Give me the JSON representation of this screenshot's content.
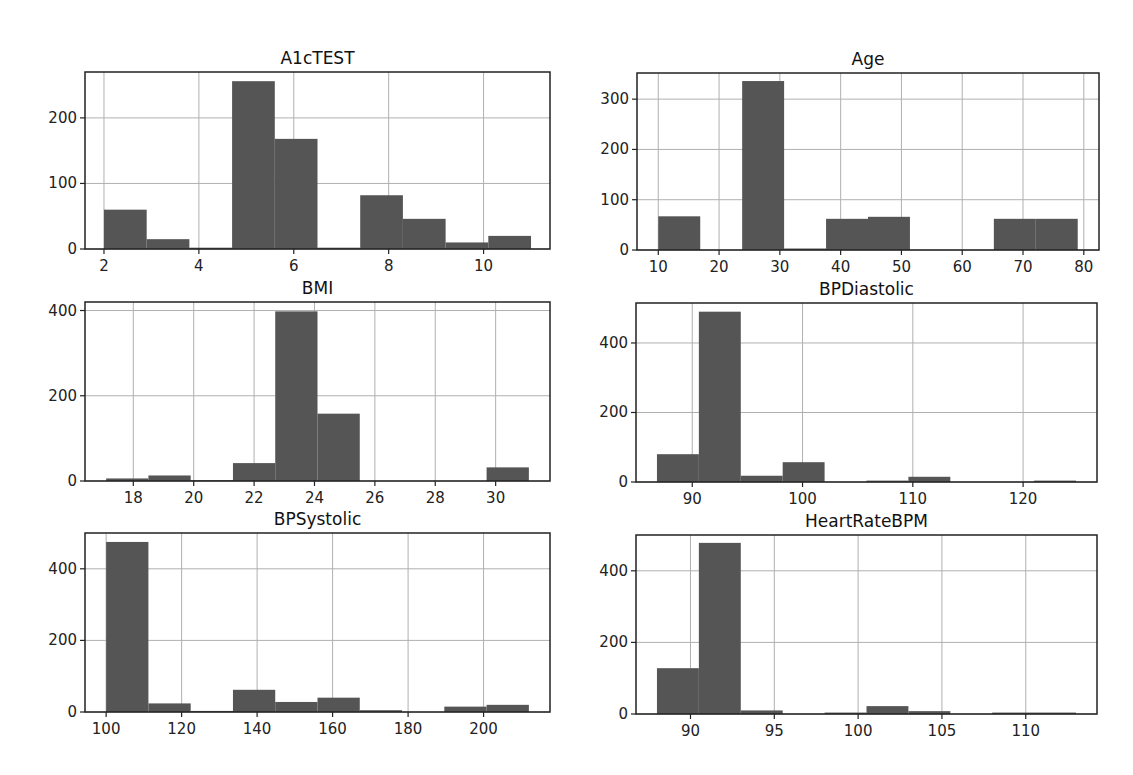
{
  "figure": {
    "background": "#ffffff",
    "bar_color": "#555555",
    "grid_color": "#b0b0b0"
  },
  "chart_data": [
    {
      "type": "bar",
      "title": "A1cTEST",
      "xlabel": "",
      "ylabel": "",
      "bin_edges": [
        2.0,
        2.9,
        3.8,
        4.7,
        5.6,
        6.5,
        7.4,
        8.3,
        9.2,
        10.1,
        11.0
      ],
      "values": [
        60,
        15,
        2,
        256,
        168,
        2,
        82,
        46,
        10,
        20
      ],
      "xticks": [
        2,
        4,
        6,
        8,
        10
      ],
      "yticks": [
        0,
        100,
        200
      ],
      "xlim": [
        1.6,
        11.4
      ],
      "ylim": [
        0,
        270
      ],
      "grid": true,
      "box": {
        "x": 85,
        "y": 72,
        "w": 465,
        "h": 177
      }
    },
    {
      "type": "bar",
      "title": "Age",
      "xlabel": "",
      "ylabel": "",
      "bin_edges": [
        10.0,
        16.9,
        23.8,
        30.7,
        37.6,
        44.5,
        51.4,
        58.3,
        65.2,
        72.1,
        79.0
      ],
      "values": [
        67,
        0,
        336,
        3,
        62,
        66,
        0,
        0,
        62,
        62
      ],
      "xticks": [
        10,
        20,
        30,
        40,
        50,
        60,
        70,
        80
      ],
      "yticks": [
        0,
        100,
        200,
        300
      ],
      "xlim": [
        6.5,
        82.5
      ],
      "ylim": [
        0,
        352
      ],
      "grid": true,
      "box": {
        "x": 637,
        "y": 73,
        "w": 462,
        "h": 177
      }
    },
    {
      "type": "bar",
      "title": "BMI",
      "xlabel": "",
      "ylabel": "",
      "bin_edges": [
        17.1,
        18.5,
        19.9,
        21.3,
        22.7,
        24.1,
        25.5,
        26.9,
        28.3,
        29.7,
        31.1
      ],
      "values": [
        6,
        13,
        2,
        42,
        398,
        158,
        0,
        0,
        0,
        32
      ],
      "xticks": [
        18,
        20,
        22,
        24,
        26,
        28,
        30
      ],
      "yticks": [
        0,
        200,
        400
      ],
      "xlim": [
        16.4,
        31.8
      ],
      "ylim": [
        0,
        420
      ],
      "grid": true,
      "box": {
        "x": 85,
        "y": 302,
        "w": 465,
        "h": 179
      }
    },
    {
      "type": "bar",
      "title": "BPDiastolic",
      "xlabel": "",
      "ylabel": "",
      "bin_edges": [
        86.8,
        90.6,
        94.4,
        98.2,
        102.0,
        105.8,
        109.6,
        113.4,
        117.2,
        121.0,
        124.8
      ],
      "values": [
        80,
        490,
        18,
        57,
        0,
        4,
        15,
        0,
        0,
        4
      ],
      "xticks": [
        90,
        100,
        110,
        120
      ],
      "yticks": [
        0,
        200,
        400
      ],
      "xlim": [
        84.9,
        126.7
      ],
      "ylim": [
        0,
        515
      ],
      "grid": true,
      "box": {
        "x": 636,
        "y": 303,
        "w": 461,
        "h": 179
      }
    },
    {
      "type": "bar",
      "title": "BPSystolic",
      "xlabel": "",
      "ylabel": "",
      "bin_edges": [
        100,
        111.2,
        122.4,
        133.6,
        144.8,
        156.0,
        167.2,
        178.4,
        189.6,
        200.8,
        212.0
      ],
      "values": [
        475,
        24,
        3,
        62,
        28,
        40,
        5,
        0,
        15,
        20
      ],
      "xticks": [
        100,
        120,
        140,
        160,
        180,
        200
      ],
      "yticks": [
        0,
        200,
        400
      ],
      "xlim": [
        94.4,
        217.6
      ],
      "ylim": [
        0,
        500
      ],
      "grid": true,
      "box": {
        "x": 85,
        "y": 533,
        "w": 465,
        "h": 179
      }
    },
    {
      "type": "bar",
      "title": "HeartRateBPM",
      "xlabel": "",
      "ylabel": "",
      "bin_edges": [
        88.0,
        90.5,
        93.0,
        95.5,
        98.0,
        100.5,
        103.0,
        105.5,
        108.0,
        110.5,
        113.0
      ],
      "values": [
        128,
        478,
        10,
        0,
        4,
        22,
        8,
        0,
        4,
        4
      ],
      "xticks": [
        90,
        95,
        100,
        105,
        110
      ],
      "yticks": [
        0,
        200,
        400
      ],
      "xlim": [
        86.75,
        114.25
      ],
      "ylim": [
        0,
        500
      ],
      "grid": true,
      "box": {
        "x": 636,
        "y": 535,
        "w": 461,
        "h": 179
      }
    }
  ]
}
